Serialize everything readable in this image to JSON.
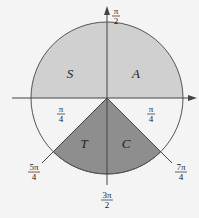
{
  "diagram": {
    "colors": {
      "background": "#f4f4f4",
      "upper_fill": "#d0d0d0",
      "sector_fill": "#8e8e8e",
      "stroke": "#555555"
    },
    "quadrant_labels": {
      "S": "S",
      "A": "A",
      "T": "T",
      "C": "C"
    },
    "axis_labels": {
      "top": {
        "num": "π",
        "den": "2"
      },
      "bottom": {
        "num": "3π",
        "den": "2"
      }
    },
    "angle_labels": {
      "left_pi4": {
        "num": "π",
        "den": "4"
      },
      "right_pi4": {
        "num": "π",
        "den": "4"
      },
      "five_pi4": {
        "num": "5π",
        "den": "4"
      },
      "seven_pi4": {
        "num": "7π",
        "den": "4"
      }
    }
  }
}
